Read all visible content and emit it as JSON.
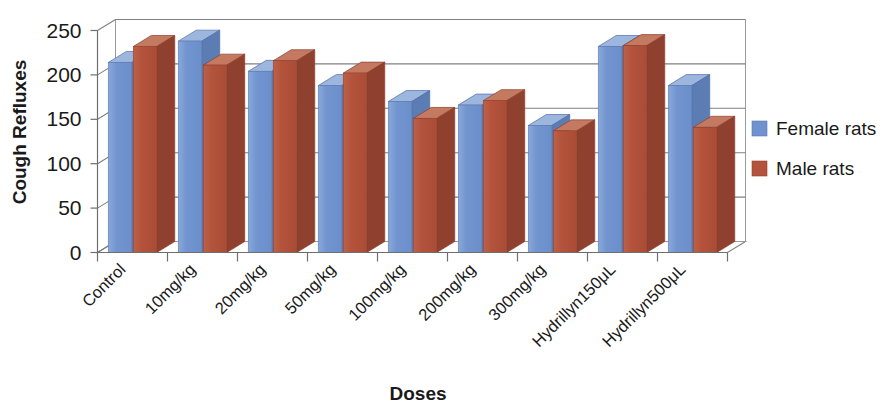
{
  "chart_data": {
    "type": "bar",
    "title": "",
    "xlabel": "Doses",
    "ylabel": "Cough Refluxes",
    "categories": [
      "Control",
      "10mg/kg",
      "20mg/kg",
      "50mg/kg",
      "100mg/kg",
      "200mg/kg",
      "300mg/kg",
      "Hydrillyn150μL",
      "Hydrillyn500μL"
    ],
    "series": [
      {
        "name": "Female rats",
        "color": "#7093cf",
        "values": [
          214,
          238,
          204,
          188,
          170,
          166,
          143,
          232,
          188
        ]
      },
      {
        "name": "Male rats",
        "color": "#b4533c",
        "values": [
          232,
          211,
          216,
          202,
          151,
          171,
          137,
          233,
          141
        ]
      }
    ],
    "ylim": [
      0,
      250
    ],
    "yticks": [
      0,
      50,
      100,
      150,
      200,
      250
    ],
    "ytick_labels": [
      "0",
      "50",
      "100",
      "150",
      "200",
      "250"
    ],
    "grid": true,
    "legend_position": "right",
    "style_3d": true
  },
  "legend": {
    "entries": [
      {
        "label": "Female rats",
        "color": "#7093cf"
      },
      {
        "label": "Male rats",
        "color": "#b4533c"
      }
    ]
  },
  "axes": {
    "y_title": "Cough Refluxes",
    "x_title": "Doses"
  }
}
